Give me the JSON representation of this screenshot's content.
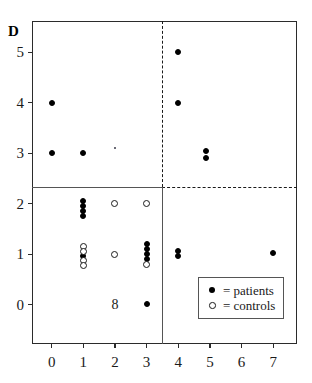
{
  "figure": {
    "corner_label": "D"
  },
  "chart_data": {
    "type": "scatter",
    "title": "",
    "subtitle": "",
    "xlabel": "",
    "ylabel": "",
    "panel_label": "D",
    "xlim": [
      -0.62,
      7.75
    ],
    "ylim": [
      -0.78,
      5.62
    ],
    "grid": false,
    "x_ticks": [
      0,
      1,
      2,
      3,
      4,
      5,
      6,
      7
    ],
    "x_tick_labels": [
      "0",
      "1",
      "2",
      "3",
      "4",
      "5",
      "6",
      "7"
    ],
    "y_ticks": [
      0,
      1,
      2,
      3,
      4,
      5
    ],
    "y_tick_labels": [
      "0",
      "1",
      "2",
      "3",
      "4",
      "5"
    ],
    "legend_position": "bottom-right",
    "series": [
      {
        "name": "patients",
        "legend_label": "= patients",
        "marker": "filled-circle",
        "color": "#000000",
        "points": [
          {
            "x": 0,
            "y": 4.0
          },
          {
            "x": 0,
            "y": 3.0
          },
          {
            "x": 1,
            "y": 3.0
          },
          {
            "x": 1,
            "y": 2.05
          },
          {
            "x": 1,
            "y": 1.95
          },
          {
            "x": 1,
            "y": 1.85
          },
          {
            "x": 1,
            "y": 1.75
          },
          {
            "x": 1,
            "y": 0.97
          },
          {
            "x": 3,
            "y": 1.2
          },
          {
            "x": 3,
            "y": 1.1
          },
          {
            "x": 3,
            "y": 1.0
          },
          {
            "x": 3,
            "y": 0.9
          },
          {
            "x": 3,
            "y": 0.02
          },
          {
            "x": 4,
            "y": 5.0
          },
          {
            "x": 4,
            "y": 4.0
          },
          {
            "x": 4,
            "y": 1.07
          },
          {
            "x": 4,
            "y": 0.96
          },
          {
            "x": 4.88,
            "y": 3.05
          },
          {
            "x": 4.88,
            "y": 2.9
          },
          {
            "x": 7,
            "y": 1.02
          }
        ]
      },
      {
        "name": "controls",
        "legend_label": "= controls",
        "marker": "open-circle",
        "color": "#1a1a1a",
        "points": [
          {
            "x": 1,
            "y": 1.15
          },
          {
            "x": 1,
            "y": 1.06
          },
          {
            "x": 1,
            "y": 0.87
          },
          {
            "x": 1,
            "y": 0.78
          },
          {
            "x": 2,
            "y": 2.0
          },
          {
            "x": 2,
            "y": 1.0
          },
          {
            "x": 3,
            "y": 2.0
          },
          {
            "x": 3,
            "y": 0.79
          }
        ]
      }
    ],
    "annotations": [
      {
        "text": "8",
        "x": 2,
        "y": 0.0,
        "name": "count-label-8"
      }
    ],
    "reference_lines": [
      {
        "orientation": "horizontal",
        "value": 2.33,
        "from_x": -0.62,
        "to_x": 3.5,
        "style": "solid",
        "color": "#555555"
      },
      {
        "orientation": "horizontal",
        "value": 2.33,
        "from_x": 3.5,
        "to_x": 7.75,
        "style": "dashed",
        "color": "#1a1a1a"
      },
      {
        "orientation": "vertical",
        "value": 3.5,
        "from_y": 2.33,
        "to_y": 5.62,
        "style": "dashed",
        "color": "#1a1a1a"
      },
      {
        "orientation": "vertical",
        "value": 3.5,
        "from_y": -0.78,
        "to_y": 2.33,
        "style": "solid",
        "color": "#555555"
      }
    ]
  },
  "legend": {
    "rows": [
      {
        "marker": "filled-circle",
        "label": "= patients"
      },
      {
        "marker": "open-circle",
        "label": "= controls"
      }
    ]
  }
}
